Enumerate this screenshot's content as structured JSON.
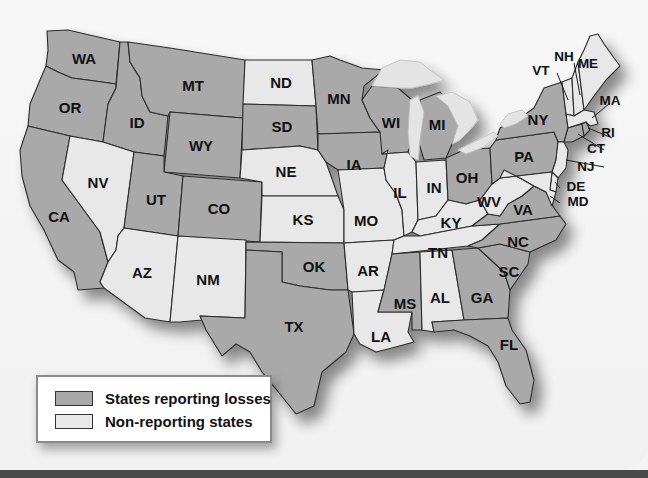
{
  "map": {
    "colors": {
      "reporting": "#a9a9a9",
      "non_reporting": "#e8e8e8",
      "border": "#2c2c2c"
    },
    "states": {
      "WA": {
        "label": "WA",
        "status": "reporting"
      },
      "OR": {
        "label": "OR",
        "status": "reporting"
      },
      "CA": {
        "label": "CA",
        "status": "reporting"
      },
      "ID": {
        "label": "ID",
        "status": "reporting"
      },
      "NV": {
        "label": "NV",
        "status": "non_reporting"
      },
      "MT": {
        "label": "MT",
        "status": "reporting"
      },
      "WY": {
        "label": "WY",
        "status": "reporting"
      },
      "UT": {
        "label": "UT",
        "status": "reporting"
      },
      "CO": {
        "label": "CO",
        "status": "reporting"
      },
      "AZ": {
        "label": "AZ",
        "status": "non_reporting"
      },
      "NM": {
        "label": "NM",
        "status": "non_reporting"
      },
      "ND": {
        "label": "ND",
        "status": "non_reporting"
      },
      "SD": {
        "label": "SD",
        "status": "reporting"
      },
      "NE": {
        "label": "NE",
        "status": "non_reporting"
      },
      "KS": {
        "label": "KS",
        "status": "non_reporting"
      },
      "OK": {
        "label": "OK",
        "status": "reporting"
      },
      "TX": {
        "label": "TX",
        "status": "reporting"
      },
      "MN": {
        "label": "MN",
        "status": "reporting"
      },
      "IA": {
        "label": "IA",
        "status": "reporting"
      },
      "MO": {
        "label": "MO",
        "status": "non_reporting"
      },
      "AR": {
        "label": "AR",
        "status": "non_reporting"
      },
      "LA": {
        "label": "LA",
        "status": "non_reporting"
      },
      "WI": {
        "label": "WI",
        "status": "reporting"
      },
      "IL": {
        "label": "IL",
        "status": "non_reporting"
      },
      "MI": {
        "label": "MI",
        "status": "reporting"
      },
      "IN": {
        "label": "IN",
        "status": "non_reporting"
      },
      "OH": {
        "label": "OH",
        "status": "reporting"
      },
      "KY": {
        "label": "KY",
        "status": "non_reporting"
      },
      "TN": {
        "label": "TN",
        "status": "non_reporting"
      },
      "MS": {
        "label": "MS",
        "status": "reporting"
      },
      "AL": {
        "label": "AL",
        "status": "non_reporting"
      },
      "GA": {
        "label": "GA",
        "status": "reporting"
      },
      "FL": {
        "label": "FL",
        "status": "reporting"
      },
      "SC": {
        "label": "SC",
        "status": "reporting"
      },
      "NC": {
        "label": "NC",
        "status": "reporting"
      },
      "VA": {
        "label": "VA",
        "status": "reporting"
      },
      "WV": {
        "label": "WV",
        "status": "non_reporting"
      },
      "PA": {
        "label": "PA",
        "status": "reporting"
      },
      "NY": {
        "label": "NY",
        "status": "reporting"
      },
      "VT": {
        "label": "VT",
        "status": "non_reporting"
      },
      "NH": {
        "label": "NH",
        "status": "non_reporting"
      },
      "ME": {
        "label": "ME",
        "status": "non_reporting"
      },
      "MA": {
        "label": "MA",
        "status": "non_reporting"
      },
      "RI": {
        "label": "RI",
        "status": "reporting"
      },
      "CT": {
        "label": "CT",
        "status": "reporting"
      },
      "NJ": {
        "label": "NJ",
        "status": "non_reporting"
      },
      "DE": {
        "label": "DE",
        "status": "non_reporting"
      },
      "MD": {
        "label": "MD",
        "status": "non_reporting"
      }
    }
  },
  "legend": {
    "items": [
      {
        "label": "States reporting losses",
        "swatch": "reporting"
      },
      {
        "label": "Non-reporting states",
        "swatch": "non_reporting"
      }
    ]
  }
}
